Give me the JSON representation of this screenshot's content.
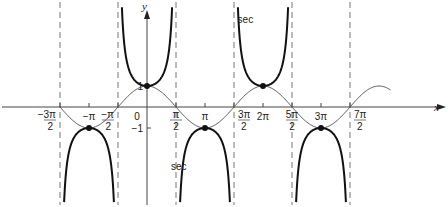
{
  "chart_data": {
    "type": "line",
    "title": "",
    "xlabel": "x",
    "ylabel": "y",
    "xlim_pi": [
      -1.5,
      4.2
    ],
    "ylim": [
      -3.4,
      4.8
    ],
    "grid": false,
    "series": [
      {
        "name": "cos",
        "function": "cos(x)",
        "style": "thin"
      },
      {
        "name": "sec",
        "function": "1/cos(x)",
        "style": "bold"
      }
    ],
    "asymptotes_pi": [
      -1.5,
      -0.5,
      0.5,
      1.5,
      2.5,
      3.5
    ],
    "marked_points": [
      {
        "x_pi": -1,
        "y": -1
      },
      {
        "x_pi": 0,
        "y": 1
      },
      {
        "x_pi": 1,
        "y": -1
      },
      {
        "x_pi": 2,
        "y": 1
      },
      {
        "x_pi": 3,
        "y": -1
      }
    ],
    "x_ticks": [
      {
        "x_pi": -1.5,
        "label": "−3π/2",
        "pos": "below-left"
      },
      {
        "x_pi": -1,
        "label": "−π"
      },
      {
        "x_pi": -0.5,
        "label": "−π/2",
        "pos": "below-left"
      },
      {
        "x_pi": 0.5,
        "label": "π/2"
      },
      {
        "x_pi": 1,
        "label": "π"
      },
      {
        "x_pi": 1.5,
        "label": "3π/2",
        "pos": "below-right"
      },
      {
        "x_pi": 2,
        "label": "2π"
      },
      {
        "x_pi": 2.5,
        "label": "5π/2"
      },
      {
        "x_pi": 3,
        "label": "3π"
      },
      {
        "x_pi": 3.5,
        "label": "7π/2",
        "pos": "below-right"
      }
    ],
    "y_ticks": [
      {
        "y": 1,
        "label": "1"
      },
      {
        "y": -1,
        "label": "−1"
      }
    ],
    "origin_label": "0",
    "annotations": [
      {
        "text": "sec",
        "x_pi": 1.7,
        "y": 4.0
      },
      {
        "text": "sec",
        "x_pi": 0.55,
        "y": -3.0
      }
    ]
  }
}
